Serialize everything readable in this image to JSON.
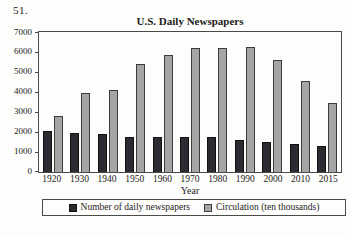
{
  "page": {
    "problem_number": "51."
  },
  "colors": {
    "background": "#fdfdfb",
    "text": "#1c1c1c",
    "plot_border": "#4a4a4a"
  },
  "chart_data": {
    "type": "bar",
    "title": "U.S. Daily Newspapers",
    "xlabel": "Year",
    "ylabel": "",
    "categories": [
      "1920",
      "1930",
      "1940",
      "1950",
      "1960",
      "1970",
      "1980",
      "1990",
      "2000",
      "2010",
      "2015"
    ],
    "series": [
      {
        "name": "Number of daily newspapers",
        "color": "#2b2b31",
        "border_color": "#111111",
        "values": [
          2042,
          1942,
          1878,
          1772,
          1763,
          1748,
          1745,
          1611,
          1480,
          1382,
          1286
        ]
      },
      {
        "name": "Circulation (ten thousands)",
        "color": "#a5a5a5",
        "border_color": "#3c3c3c",
        "values": [
          2780,
          3960,
          4110,
          5380,
          5870,
          6210,
          6220,
          6230,
          5580,
          4540,
          3440
        ]
      }
    ],
    "ylim": [
      0,
      7000
    ],
    "yticks": [
      0,
      1000,
      2000,
      3000,
      4000,
      5000,
      6000,
      7000
    ],
    "grid": false,
    "legend_position": "bottom"
  }
}
